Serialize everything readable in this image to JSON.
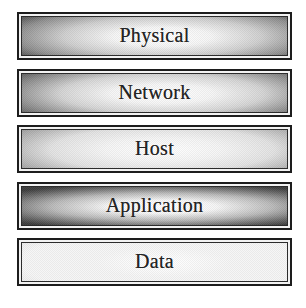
{
  "diagram": {
    "type": "stacked-layer-diagram",
    "layers": [
      {
        "label": "Physical",
        "tone": "#5c5c5c"
      },
      {
        "label": "Network",
        "tone": "#606060"
      },
      {
        "label": "Host",
        "tone": "#7a7a7a"
      },
      {
        "label": "Application",
        "tone": "#3c3c3c"
      },
      {
        "label": "Data",
        "tone": "#bdbdbd"
      }
    ],
    "colors": {
      "background": "#ffffff",
      "outer_border": "#1d1d1d",
      "inner_border": "#2c2c2c",
      "text": "#242424"
    }
  }
}
